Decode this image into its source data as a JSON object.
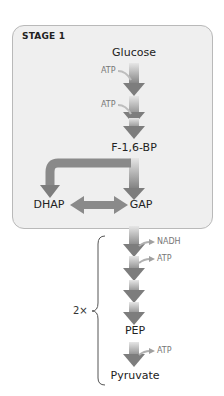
{
  "diagram": {
    "stage_label": "STAGE 1",
    "metabolites": {
      "glucose": "Glucose",
      "f16bp": "F-1,6-BP",
      "dhap": "DHAP",
      "gap": "GAP",
      "pep": "PEP",
      "pyruvate": "Pyruvate"
    },
    "cofactors": {
      "atp_in_1": "ATP",
      "atp_in_2": "ATP",
      "nadh_out": "NADH",
      "atp_out_1": "ATP",
      "atp_out_2": "ATP"
    },
    "multiplier": "2×",
    "colors": {
      "panel_fill": "#efefef",
      "panel_border": "#b9b9b9",
      "arrow_dark": "#808080",
      "arrow_light": "#d8d8d8",
      "cofactor_text": "#777777"
    }
  }
}
